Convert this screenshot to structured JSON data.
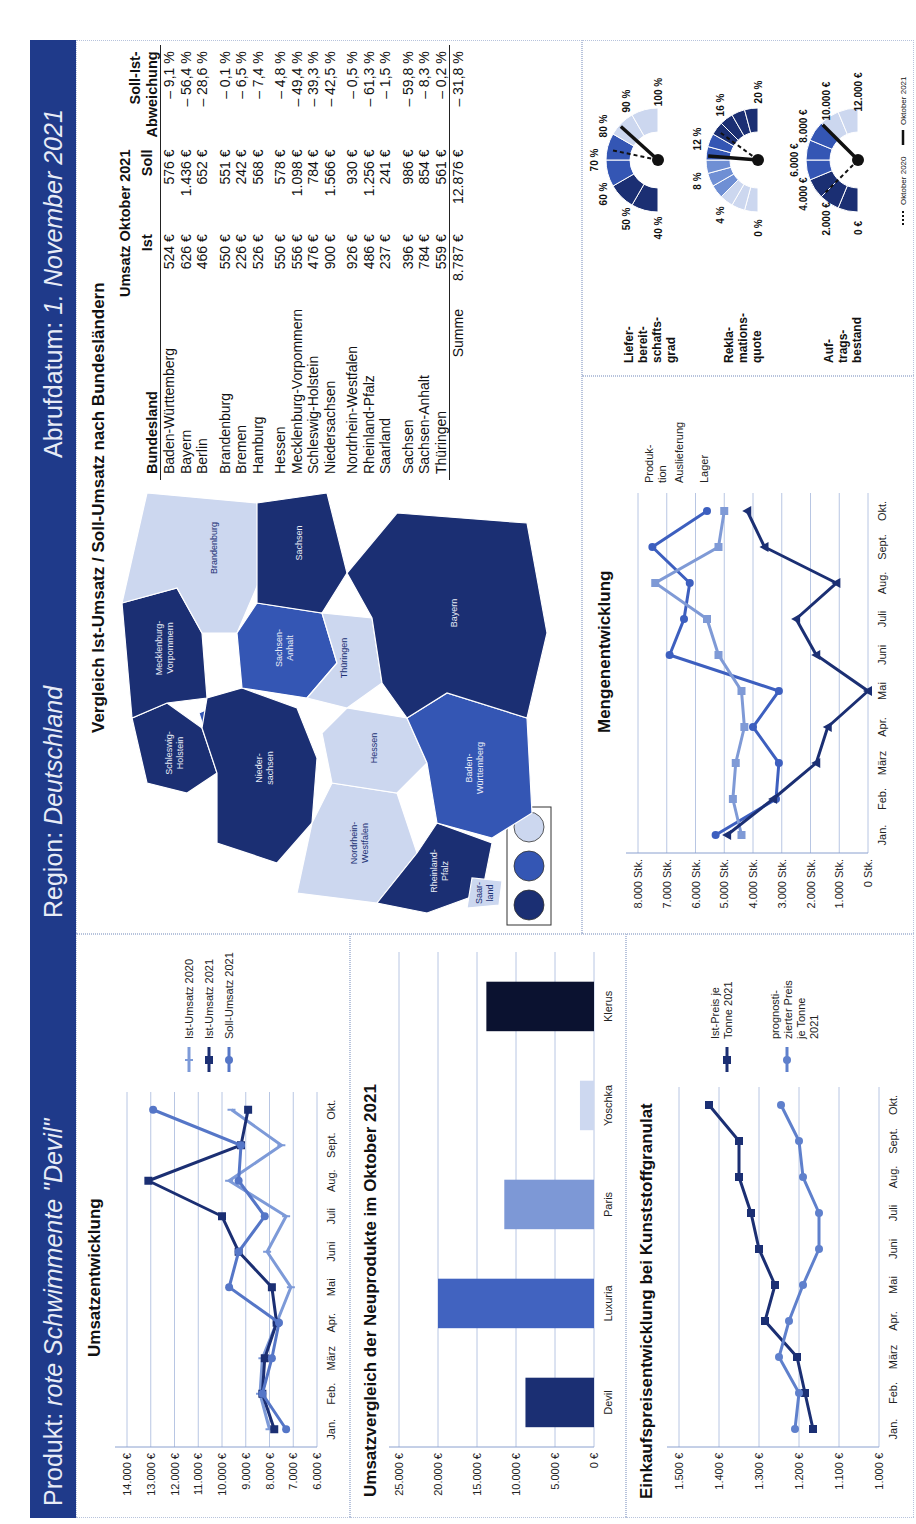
{
  "header": {
    "product_label": "Produkt:",
    "product_value": "rote Schwimmente \"Devil\"",
    "region_label": "Region:",
    "region_value": "Deutschland",
    "date_label": "Abrufdatum:",
    "date_value": "1. November 2021",
    "band_color": "#1f3a8a"
  },
  "colors": {
    "dark": "#1b2f73",
    "mid": "#3456b4",
    "light": "#6f8fd4",
    "pale": "#ccd7ef",
    "black": "#0b1230"
  },
  "map": {
    "title": "Vergleich Ist-Umsatz / Soll-Umsatz nach Bundesländern",
    "legend": [
      "dark",
      "mid",
      "pale"
    ],
    "labels": {
      "sh": "Schleswig-\nHolstein",
      "hh": "Hamburg",
      "mv": "Mecklenburg-\nVorpommern",
      "hb": "Bremen",
      "ni": "Nieder-\nsachsen",
      "be": "Berlin",
      "bb": "Brandenburg",
      "st": "Sachsen-\nAnhalt",
      "sn": "Sachsen",
      "nw": "Nordrhein-\nWestfalen",
      "he": "Hessen",
      "th": "Thüringen",
      "rp": "Rheinland-\nPfalz",
      "sl": "Saar-\nland",
      "bw": "Baden-\nWürttemberg",
      "by": "Bayern"
    }
  },
  "table": {
    "group_header": "Umsatz Oktober 2021",
    "col_land": "Bundesland",
    "col_ist": "Ist",
    "col_soll": "Soll",
    "col_dev": "Soll-Ist-\nAbweichung",
    "rows": [
      {
        "land": "Baden-Württemberg",
        "ist": "524 €",
        "soll": "576 €",
        "dev": "– 9,1 %"
      },
      {
        "land": "Bayern",
        "ist": "626 €",
        "soll": "1.436 €",
        "dev": "– 56,4 %"
      },
      {
        "land": "Berlin",
        "ist": "466 €",
        "soll": "652 €",
        "dev": "– 28,6 %"
      },
      {
        "land": "Brandenburg",
        "ist": "550 €",
        "soll": "551 €",
        "dev": "– 0,1 %"
      },
      {
        "land": "Bremen",
        "ist": "226 €",
        "soll": "242 €",
        "dev": "– 6,5 %"
      },
      {
        "land": "Hamburg",
        "ist": "526 €",
        "soll": "568 €",
        "dev": "– 7,4 %"
      },
      {
        "land": "Hessen",
        "ist": "550 €",
        "soll": "578 €",
        "dev": "– 4,8 %"
      },
      {
        "land": "Mecklenburg-Vorpommern",
        "ist": "556 €",
        "soll": "1.098 €",
        "dev": "– 49,4 %"
      },
      {
        "land": "Schleswig-Holstein",
        "ist": "476 €",
        "soll": "784 €",
        "dev": "– 39,3 %"
      },
      {
        "land": "Niedersachsen",
        "ist": "900 €",
        "soll": "1.566 €",
        "dev": "– 42,5 %"
      },
      {
        "land": "Nordrhein-Westfalen",
        "ist": "926 €",
        "soll": "930 €",
        "dev": "– 0,5 %"
      },
      {
        "land": "Rheinland-Pfalz",
        "ist": "486 €",
        "soll": "1.256 €",
        "dev": "– 61,3 %"
      },
      {
        "land": "Saarland",
        "ist": "237 €",
        "soll": "241 €",
        "dev": "– 1,5 %"
      },
      {
        "land": "Sachsen",
        "ist": "396 €",
        "soll": "986 €",
        "dev": "– 59,8 %"
      },
      {
        "land": "Sachsen-Anhalt",
        "ist": "784 €",
        "soll": "854 €",
        "dev": "– 8,3 %"
      },
      {
        "land": "Thüringen",
        "ist": "559 €",
        "soll": "561 €",
        "dev": "– 0,2 %"
      }
    ],
    "sum_label": "Summe",
    "sum_ist": "8.787 €",
    "sum_soll": "12.876 €",
    "sum_dev": "– 31,8 %"
  },
  "gauges": {
    "legend_2020": "Oktober 2020",
    "legend_2021": "Oktober 2021",
    "items": [
      {
        "label": "Liefer-\nbereit-\nschafts-\ngrad",
        "ticks": [
          "40 %",
          "50 %",
          "60 %",
          "70 %",
          "80 %",
          "90 %",
          "100 %"
        ],
        "min": 40,
        "max": 100,
        "value_2020": 74,
        "value_2021": 84,
        "segments": [
          "dark",
          "dark",
          "mid",
          "mid",
          "pale",
          "pale"
        ]
      },
      {
        "label": "Rekla-\nmations-\nquote",
        "ticks": [
          "0 %",
          "4 %",
          "8 %",
          "12 %",
          "16 %",
          "20 %"
        ],
        "min": 0,
        "max": 20,
        "value_2020": 14,
        "value_2021": 10.5,
        "segments": [
          "pale",
          "pale",
          "pale",
          "light",
          "light",
          "light",
          "mid",
          "mid",
          "dark",
          "dark",
          "dark",
          "dark"
        ]
      },
      {
        "label": "Auf-\ntrags-\nbestand",
        "ticks": [
          "0 €",
          "2.000 €",
          "4.000 €",
          "6.000 €",
          "8.000 €",
          "10.000 €",
          "12.000 €"
        ],
        "min": 0,
        "max": 12000,
        "value_2020": 3000,
        "value_2021": 9000,
        "segments": [
          "dark",
          "dark",
          "dark",
          "mid",
          "mid",
          "mid",
          "pale",
          "pale"
        ]
      }
    ]
  },
  "chart_data": [
    {
      "type": "line",
      "title": "Umsatzentwicklung",
      "categories": [
        "Jan.",
        "Feb.",
        "März",
        "Apr.",
        "Mai",
        "Juni",
        "Juli",
        "Aug.",
        "Sept.",
        "Okt."
      ],
      "yticks": [
        "6.000 €",
        "7.000 €",
        "8.000 €",
        "9.000 €",
        "10.000 €",
        "11.000 €",
        "12.000 €",
        "13.000 €",
        "14.000 €"
      ],
      "ylim": [
        6000,
        14000
      ],
      "series": [
        {
          "name": "Ist-Umsatz 2020",
          "color": "#7d9ad8",
          "marker": "line",
          "values": [
            8000,
            8400,
            8300,
            7700,
            7100,
            8100,
            7300,
            9700,
            7500,
            9600
          ]
        },
        {
          "name": "Ist-Umsatz 2021",
          "color": "#1b2f73",
          "marker": "square",
          "values": [
            7800,
            8300,
            8200,
            7700,
            7900,
            9300,
            10000,
            13100,
            9200,
            8900
          ]
        },
        {
          "name": "Soll-Umsatz 2021",
          "color": "#5576c7",
          "marker": "circle",
          "values": [
            7300,
            8300,
            7900,
            7600,
            9700,
            9300,
            8200,
            9300,
            9200,
            12900
          ]
        }
      ],
      "xlabel": "",
      "ylabel": "",
      "grid": true,
      "legend_position": "right"
    },
    {
      "type": "bar",
      "title": "Umsatzvergleich der Neuprodukte im Oktober 2021",
      "categories": [
        "Devil",
        "Luxuria",
        "Paris",
        "Yoschka",
        "Klerus"
      ],
      "values": [
        8787,
        20000,
        11500,
        1800,
        13800
      ],
      "colors": [
        "#1b2f73",
        "#4163c0",
        "#7d98d6",
        "#cdd8f0",
        "#0b1230"
      ],
      "yticks": [
        "0 €",
        "5.000 €",
        "10.000 €",
        "15.000 €",
        "20.000 €",
        "25.000 €"
      ],
      "ylim": [
        0,
        25000
      ],
      "xlabel": "",
      "ylabel": "",
      "grid": true
    },
    {
      "type": "line",
      "title": "Einkaufspreisentwicklung bei Kunststoffgranulat",
      "categories": [
        "Jan.",
        "Feb.",
        "März",
        "Apr.",
        "Mai",
        "Juni",
        "Juli",
        "Aug.",
        "Sept.",
        "Okt."
      ],
      "yticks": [
        "1.000 €",
        "1.100 €",
        "1.200 €",
        "1.300 €",
        "1.400 €",
        "1.500 €"
      ],
      "ylim": [
        1000,
        1500
      ],
      "series": [
        {
          "name": "Ist-Preis je Tonne 2021",
          "color": "#1b2f73",
          "marker": "square",
          "values": [
            1165,
            1185,
            1205,
            1285,
            1260,
            1300,
            1320,
            1350,
            1350,
            1425
          ]
        },
        {
          "name": "prognosti-zierter Preis je Tonne 2021",
          "color": "#5f80cc",
          "marker": "circle",
          "values": [
            1210,
            1200,
            1250,
            1225,
            1190,
            1150,
            1150,
            1190,
            1200,
            1245
          ]
        }
      ],
      "xlabel": "",
      "ylabel": "",
      "grid": true,
      "legend_position": "right"
    },
    {
      "type": "line",
      "title": "Mengenentwicklung",
      "categories": [
        "Jan.",
        "Feb.",
        "März",
        "Apr.",
        "Mai",
        "Juni",
        "Juli",
        "Aug.",
        "Sept.",
        "Okt."
      ],
      "yticks": [
        "0 Stk.",
        "1.000 Stk.",
        "2.000 Stk.",
        "3.000 Stk.",
        "4.000 Stk.",
        "5.000 Stk.",
        "6.000 Stk.",
        "7.000 Stk.",
        "8.000 Stk."
      ],
      "ylim": [
        0,
        8000
      ],
      "series": [
        {
          "name": "Produk-tion",
          "color": "#3d5fbf",
          "marker": "circle",
          "values": [
            5300,
            3200,
            3100,
            4000,
            3100,
            6900,
            6400,
            6200,
            7500,
            5600
          ]
        },
        {
          "name": "Auslieferung",
          "color": "#7f9ad6",
          "marker": "square",
          "values": [
            4400,
            4700,
            4600,
            4300,
            4400,
            5200,
            5600,
            7400,
            5200,
            5000
          ]
        },
        {
          "name": "Lager",
          "color": "#1b2f73",
          "marker": "triangle",
          "values": [
            4900,
            3300,
            1800,
            1400,
            0,
            1800,
            2500,
            1100,
            3600,
            4200
          ]
        }
      ],
      "xlabel": "",
      "ylabel": "",
      "grid": true,
      "legend_position": "right-inline"
    }
  ]
}
